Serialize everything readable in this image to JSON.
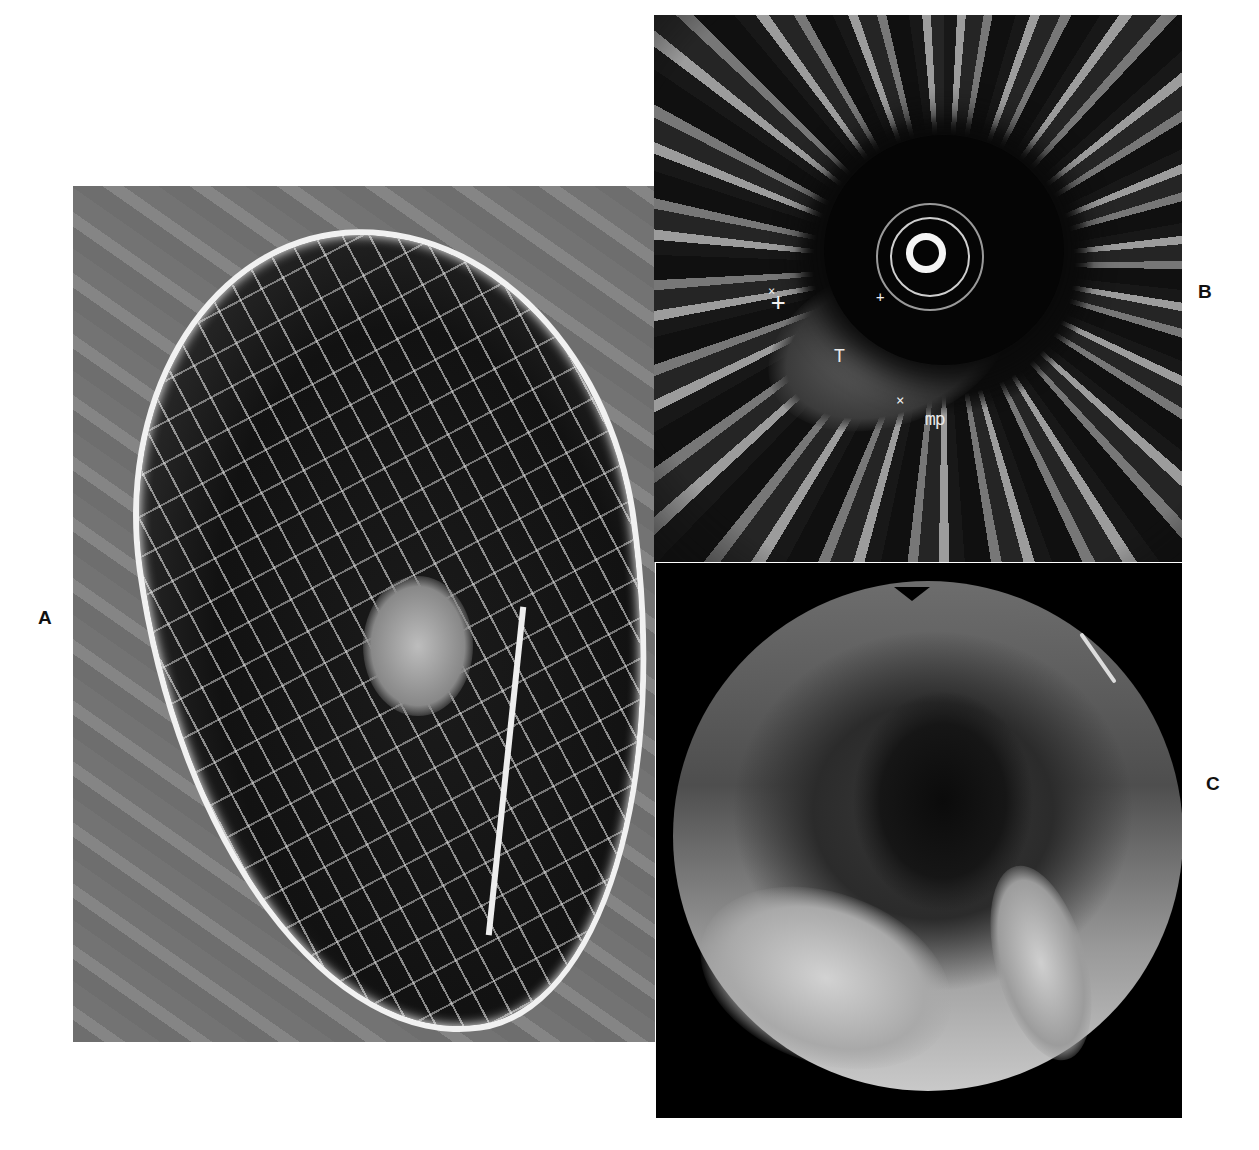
{
  "figure": {
    "panels": [
      {
        "id": "A",
        "label": "A",
        "description": "Radiograph of resected specimen with contrast showing mucosal pattern and mass"
      },
      {
        "id": "B",
        "label": "B",
        "description": "Endoscopic ultrasound image with measurement markers",
        "annotations": {
          "tumor": "T",
          "muscularis_propria": "mp"
        }
      },
      {
        "id": "C",
        "label": "C",
        "description": "Endoscopic view of lumen with irregular mucosal mass"
      }
    ]
  }
}
